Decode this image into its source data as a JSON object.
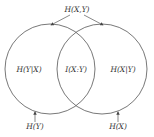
{
  "diagram": {
    "title_label": "H(X,Y)",
    "regions": {
      "left_only": "H(Y|X)",
      "intersection": "I(X:Y)",
      "right_only": "H(X|Y)"
    },
    "circles": {
      "left": "H(Y)",
      "right": "H(X)"
    },
    "colors": {
      "stroke": "#555555",
      "text": "#333333"
    }
  }
}
